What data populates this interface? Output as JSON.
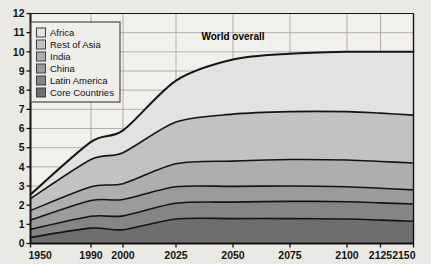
{
  "chart_data": {
    "type": "area",
    "title": "",
    "subtitle": "",
    "xlabel": "",
    "ylabel": "",
    "stacked": true,
    "grid": true,
    "legend_position": "top-left",
    "xlim": [
      1950,
      2150
    ],
    "ylim": [
      0,
      12
    ],
    "yticks": [
      0,
      1,
      2,
      3,
      4,
      5,
      6,
      7,
      8,
      9,
      10,
      11,
      12
    ],
    "x": [
      1950,
      1990,
      2000,
      2025,
      2050,
      2075,
      2100,
      2125,
      2150
    ],
    "xtick_labels": [
      "1950",
      "1990",
      "2000",
      "2025",
      "2050",
      "2075",
      "2100",
      "2125",
      "2150"
    ],
    "annotations": [
      {
        "text": "World overall",
        "x": 2038,
        "y": 10.6
      }
    ],
    "series": [
      {
        "name": "Core Countries",
        "color": "#6e6e6e",
        "values": [
          0.32,
          0.8,
          0.72,
          1.28,
          1.3,
          1.3,
          1.28,
          1.22,
          1.16
        ]
      },
      {
        "name": "Latin America",
        "color": "#858585",
        "values": [
          0.42,
          0.62,
          0.72,
          0.82,
          0.86,
          0.9,
          0.9,
          0.9,
          0.9
        ]
      },
      {
        "name": "China",
        "color": "#9b9b9b",
        "values": [
          0.48,
          0.82,
          0.86,
          0.86,
          0.82,
          0.8,
          0.78,
          0.76,
          0.74
        ]
      },
      {
        "name": "India",
        "color": "#aeaeae",
        "values": [
          0.5,
          0.72,
          0.82,
          1.2,
          1.32,
          1.38,
          1.4,
          1.4,
          1.4
        ]
      },
      {
        "name": "Rest of Asia",
        "color": "#c2c2c2",
        "values": [
          0.62,
          1.42,
          1.62,
          2.18,
          2.45,
          2.5,
          2.52,
          2.52,
          2.5
        ]
      },
      {
        "name": "Africa",
        "color": "#e2e2e2",
        "values": [
          0.22,
          0.92,
          1.16,
          2.16,
          2.85,
          3.02,
          3.12,
          3.2,
          3.3
        ]
      }
    ],
    "series_totals_note": "",
    "world_overall_totals": [
      2.56,
      5.3,
      5.9,
      8.5,
      9.6,
      9.9,
      10.0,
      10.0,
      11.96
    ]
  },
  "legend": {
    "items": [
      {
        "label": "Africa",
        "color": "#e2e2e2"
      },
      {
        "label": "Rest of Asia",
        "color": "#c2c2c2"
      },
      {
        "label": "India",
        "color": "#aeaeae"
      },
      {
        "label": "China",
        "color": "#9b9b9b"
      },
      {
        "label": "Latin America",
        "color": "#858585"
      },
      {
        "label": "Core Countries",
        "color": "#6e6e6e"
      }
    ]
  },
  "colors": {
    "background": "#ebe9e4",
    "plot_background": "#f2f0ec",
    "axis": "#14120f",
    "grid": "#a9a6a0",
    "band_outline": "#141414",
    "legend_bg": "#efeeea",
    "legend_border": "#4a4a4a"
  }
}
